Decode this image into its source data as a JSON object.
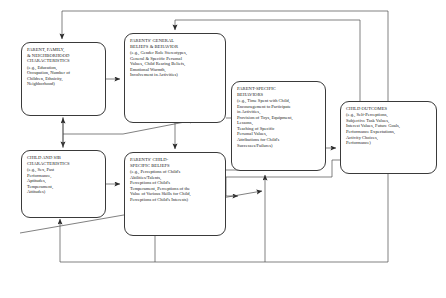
{
  "figure": {
    "type": "diagram",
    "kind": "flow-model",
    "line_color": "#3a3a3a",
    "text_color": "#1a1a1a",
    "background": "#ffffff"
  },
  "nodes": [
    {
      "id": "parent-family",
      "title": "PARENT, FAMILY,\n& NEIGHBORHOOD\nCHARACTERISTICS",
      "examples": "(e.g., Education,\nOccupation, Number of\nChildren, Ethnicity,\nNeighborhood)"
    },
    {
      "id": "general-beliefs",
      "title": "PARENTS' GENERAL\nBELIEFS & BEHAVIOR",
      "examples": "(e.g., Gender Role Stereotypes,\nGeneral & Specific Personal\nValues, Child Rearing Beliefs,\nEmotional Warmth,\nInvolvement in Activities)"
    },
    {
      "id": "parent-behaviors",
      "title": "PARENT-SPECIFIC\nBEHAVIORS",
      "examples": "(e.g., Time Spent with Child,\nEncouragement to Participate\nin Activities,\nProvision of Toys, Equipment,\nLessons,\nTeaching of Specific\nPersonal Values,\nAttributions for Child's\nSuccesses/Failures)"
    },
    {
      "id": "child-outcomes",
      "title": "CHILD OUTCOMES",
      "examples": "(e.g., Self-Perceptions,\nSubjective Task Values,\nInterest Values, Future Goals,\nPerformance Expectations,\nActivity Choices,\nPerformance)"
    },
    {
      "id": "child-sib",
      "title": "CHILD AND SIB\nCHARACTERISTICS",
      "examples": "(e.g., Sex, Past\nPerformance,\nAptitudes,\nTemperament,\nAttitudes)"
    },
    {
      "id": "child-beliefs",
      "title": "PARENTS' CHILD-\nSPECIFIC BELIEFS",
      "examples": "(e.g., Perceptions of Child's\nAbilities/Talents,\nPerceptions of Child's\nTemperament, Perceptions of the\nValue of Various Skills for Child,\nPerceptions of Child's Interests)"
    }
  ],
  "edges": [
    {
      "from": "parent-family",
      "to": "general-beliefs",
      "style": "arrow"
    },
    {
      "from": "parent-family",
      "to": "child-sib",
      "style": "double-arrow"
    },
    {
      "from": "general-beliefs",
      "to": "parent-behaviors",
      "style": "arrow"
    },
    {
      "from": "general-beliefs",
      "to": "child-beliefs",
      "style": "arrow"
    },
    {
      "from": "child-sib",
      "to": "child-beliefs",
      "style": "arrow"
    },
    {
      "from": "child-sib",
      "to": "general-beliefs",
      "style": "arrow"
    },
    {
      "from": "child-beliefs",
      "to": "parent-behaviors",
      "style": "arrow"
    },
    {
      "from": "parent-behaviors",
      "to": "child-outcomes",
      "style": "arrow"
    },
    {
      "from": "child-outcomes",
      "to": "parent-behaviors",
      "style": "feedback-arrow"
    },
    {
      "from": "child-outcomes",
      "to": "child-beliefs",
      "style": "feedback-arrow"
    },
    {
      "from": "child-outcomes",
      "to": "general-beliefs",
      "style": "feedback-arrow"
    },
    {
      "from": "child-outcomes",
      "to": "parent-family",
      "style": "feedback-arrow"
    },
    {
      "from": "child-sib",
      "to": "child-outcomes",
      "style": "feedback-arrow"
    }
  ]
}
